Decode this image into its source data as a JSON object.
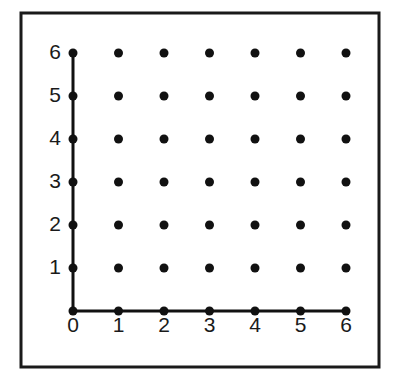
{
  "figure": {
    "background_color": "#ffffff",
    "width": 400,
    "height": 380
  },
  "frame": {
    "name": "outer-border",
    "x": 21,
    "y": 13,
    "width": 358,
    "height": 354,
    "stroke_color": "#1a1a1a",
    "stroke_width": 3,
    "fill": "none"
  },
  "chart_data": {
    "type": "scatter",
    "title": "",
    "subtitle": "",
    "xlabel": "",
    "ylabel": "",
    "xlim": [
      0,
      6
    ],
    "ylim": [
      0,
      6
    ],
    "grid": false,
    "legend": null,
    "x_ticks": [
      0,
      1,
      2,
      3,
      4,
      5,
      6
    ],
    "y_ticks": [
      0,
      1,
      2,
      3,
      4,
      5,
      6
    ],
    "x_tick_labels": [
      "0",
      "1",
      "2",
      "3",
      "4",
      "5",
      "6"
    ],
    "y_tick_labels": [
      "0",
      "1",
      "2",
      "3",
      "4",
      "5",
      "6"
    ],
    "point_count": 49,
    "marker": {
      "shape": "circle",
      "color": "#111111",
      "radius_px": 4.5
    },
    "points": [
      {
        "x": 0,
        "y": 0
      },
      {
        "x": 1,
        "y": 0
      },
      {
        "x": 2,
        "y": 0
      },
      {
        "x": 3,
        "y": 0
      },
      {
        "x": 4,
        "y": 0
      },
      {
        "x": 5,
        "y": 0
      },
      {
        "x": 6,
        "y": 0
      },
      {
        "x": 0,
        "y": 1
      },
      {
        "x": 1,
        "y": 1
      },
      {
        "x": 2,
        "y": 1
      },
      {
        "x": 3,
        "y": 1
      },
      {
        "x": 4,
        "y": 1
      },
      {
        "x": 5,
        "y": 1
      },
      {
        "x": 6,
        "y": 1
      },
      {
        "x": 0,
        "y": 2
      },
      {
        "x": 1,
        "y": 2
      },
      {
        "x": 2,
        "y": 2
      },
      {
        "x": 3,
        "y": 2
      },
      {
        "x": 4,
        "y": 2
      },
      {
        "x": 5,
        "y": 2
      },
      {
        "x": 6,
        "y": 2
      },
      {
        "x": 0,
        "y": 3
      },
      {
        "x": 1,
        "y": 3
      },
      {
        "x": 2,
        "y": 3
      },
      {
        "x": 3,
        "y": 3
      },
      {
        "x": 4,
        "y": 3
      },
      {
        "x": 5,
        "y": 3
      },
      {
        "x": 6,
        "y": 3
      },
      {
        "x": 0,
        "y": 4
      },
      {
        "x": 1,
        "y": 4
      },
      {
        "x": 2,
        "y": 4
      },
      {
        "x": 3,
        "y": 4
      },
      {
        "x": 4,
        "y": 4
      },
      {
        "x": 5,
        "y": 4
      },
      {
        "x": 6,
        "y": 4
      },
      {
        "x": 0,
        "y": 5
      },
      {
        "x": 1,
        "y": 5
      },
      {
        "x": 2,
        "y": 5
      },
      {
        "x": 3,
        "y": 5
      },
      {
        "x": 4,
        "y": 5
      },
      {
        "x": 5,
        "y": 5
      },
      {
        "x": 6,
        "y": 5
      },
      {
        "x": 0,
        "y": 6
      },
      {
        "x": 1,
        "y": 6
      },
      {
        "x": 2,
        "y": 6
      },
      {
        "x": 3,
        "y": 6
      },
      {
        "x": 4,
        "y": 6
      },
      {
        "x": 5,
        "y": 6
      },
      {
        "x": 6,
        "y": 6
      }
    ],
    "axes_lines": {
      "x_axis": {
        "from": [
          0,
          0
        ],
        "to": [
          6,
          0
        ],
        "color": "#111111",
        "width_px": 3
      },
      "y_axis": {
        "from": [
          0,
          0
        ],
        "to": [
          0,
          6
        ],
        "color": "#111111",
        "width_px": 3
      }
    }
  },
  "geometry": {
    "origin_px": {
      "x": 73,
      "y": 311
    },
    "x_step_px": 45.5,
    "y_step_px": 43,
    "x_label_offset_px": 6,
    "y_label_offset_px": 12
  }
}
